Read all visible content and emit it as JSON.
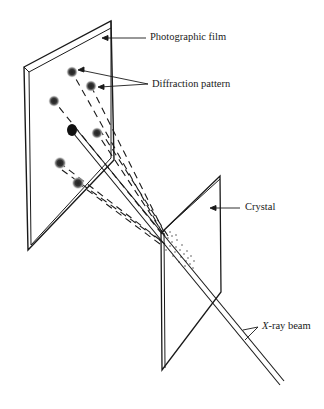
{
  "figure": {
    "labels": {
      "film": "Photographic film",
      "pattern": "Diffraction pattern",
      "crystal": "Crystal",
      "beam_prefix": "X",
      "beam_suffix": "-ray beam"
    }
  }
}
